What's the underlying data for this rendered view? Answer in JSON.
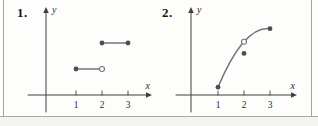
{
  "page": {
    "figure_labels": [
      "1.",
      "2."
    ]
  },
  "style": {
    "axis_color": "#3f3f3f",
    "curve_color": "#757575",
    "marker_fill": "#4d4d4d",
    "open_marker_fill": "#fdfdfc",
    "tick_label_color": "#2b2b2b",
    "axis_label_color": "#2b2b2b",
    "border_color": "#a3a3a1"
  },
  "chart_data": [
    {
      "type": "line",
      "title": "",
      "xlabel": "x",
      "ylabel": "y",
      "x_ticks": [
        1,
        2,
        3
      ],
      "xlim": [
        0,
        4
      ],
      "ylim": [
        0,
        3.3
      ],
      "grid": false,
      "legend": false,
      "description": "Step function: two horizontal segments",
      "segments": [
        {
          "x1": 1,
          "y1": 1,
          "x2": 2,
          "y2": 1,
          "start_marker": "closed",
          "end_marker": "open"
        },
        {
          "x1": 2,
          "y1": 2,
          "x2": 3,
          "y2": 2,
          "start_marker": "closed",
          "end_marker": "closed"
        }
      ]
    },
    {
      "type": "line",
      "title": "",
      "xlabel": "x",
      "ylabel": "y",
      "x_ticks": [
        1,
        2,
        3
      ],
      "xlim": [
        0,
        4
      ],
      "ylim": [
        0,
        3.3
      ],
      "grid": false,
      "legend": false,
      "description": "Concave increasing curve with a removable point at x=2",
      "curve": {
        "shape": "concave-increasing",
        "points": [
          {
            "x": 1,
            "y": 0.3,
            "marker": "closed"
          },
          {
            "x": 2,
            "y": 2.05,
            "marker": "open"
          },
          {
            "x": 3,
            "y": 2.55,
            "marker": "closed"
          }
        ]
      },
      "isolated_points": [
        {
          "x": 2,
          "y": 1.6,
          "marker": "closed"
        }
      ]
    }
  ]
}
